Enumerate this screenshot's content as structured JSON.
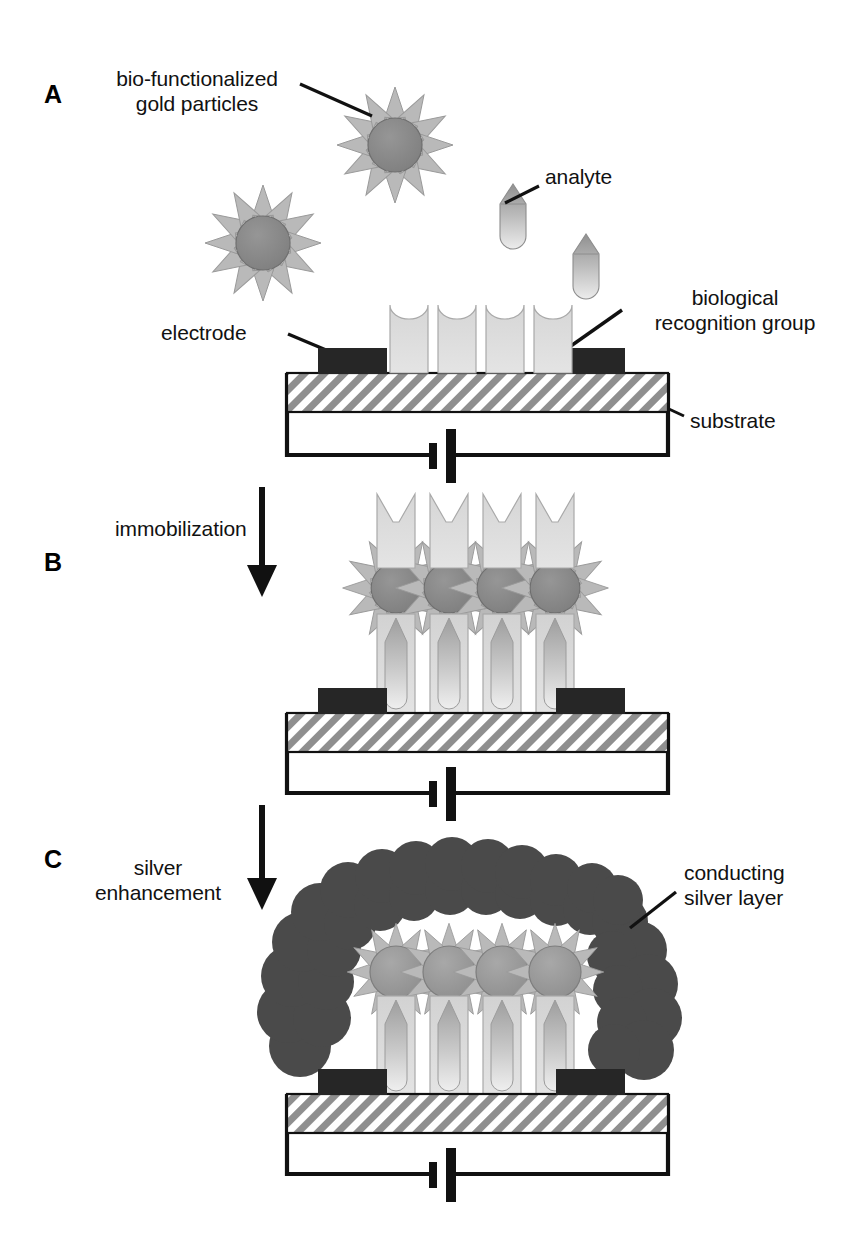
{
  "figure": {
    "background": "#ffffff"
  },
  "panels": [
    {
      "letter": "A",
      "step": "capture"
    },
    {
      "letter": "B",
      "step": "immobilization"
    },
    {
      "letter": "C",
      "step": "silver enhancement"
    }
  ],
  "labels": {
    "panel_a_letter": "A",
    "panel_b_letter": "B",
    "panel_c_letter": "C",
    "gold_particles_line1": "bio-functionalized",
    "gold_particles_line2": "gold particles",
    "analyte": "analyte",
    "electrode": "electrode",
    "recognition_line1": "biological",
    "recognition_line2": "recognition group",
    "substrate": "substrate",
    "immobilization": "immobilization",
    "silver_line1": "silver",
    "silver_line2": "enhancement",
    "conducting_line1": "conducting",
    "conducting_line2": "silver layer"
  },
  "colors": {
    "outline": "#111111",
    "electrode": "#262626",
    "gold_core": "#8a8a8a",
    "gold_spike": "#b9b9b9",
    "recognition_light": "#dddddd",
    "recognition_mid": "#c3c3c3",
    "analyte_dark": "#9a9a9a",
    "analyte_light": "#e8e8e8",
    "silver_layer": "#4a4a4a",
    "substrate_hatch": "#8f8f8f",
    "substrate_bg": "#ffffff",
    "text": "#111111"
  },
  "geometry": {
    "recognition_group_count": 4,
    "free_gold_particles": 2,
    "free_analytes": 2,
    "bound_complexes": 4,
    "gold_spike_count": 12,
    "silver_blob_circles": 26
  },
  "circuit": {
    "symbol": "battery",
    "description": "two-plate battery cell in series loop between left and right electrode"
  }
}
